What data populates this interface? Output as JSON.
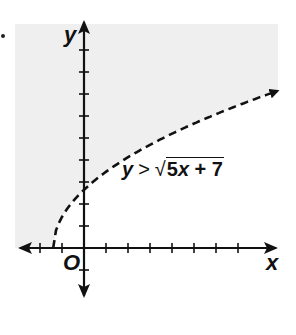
{
  "figure": {
    "axis_labels": {
      "x": "x",
      "y": "y",
      "origin": "O"
    },
    "inequality": {
      "lhs": "y",
      "operator": ">",
      "radical": "√",
      "radicand_coeff": "5",
      "radicand_var": "x",
      "radicand_rest": " + 7"
    },
    "boundary_style": "dashed",
    "shaded_region": "above curve",
    "colors": {
      "shade": "#efefef",
      "axis": "#111111",
      "curve": "#111111"
    }
  },
  "chart_data": {
    "type": "line",
    "title": "",
    "equation": "y > sqrt(5x + 7)",
    "boundary": "y = sqrt(5x + 7)",
    "boundary_line": "dashed",
    "shading": "region above the curve (y > sqrt(5x+7))",
    "xlabel": "x",
    "ylabel": "y",
    "origin_label": "O",
    "xlim": [
      -3,
      9
    ],
    "ylim": [
      -1,
      9
    ],
    "tick_spacing": 1,
    "grid": false,
    "x": [
      -1.4,
      -1,
      0,
      1,
      2,
      3,
      4,
      5,
      6,
      7,
      8,
      8.8
    ],
    "y": [
      0,
      1.41,
      2.65,
      3.46,
      4.12,
      4.69,
      5.2,
      5.66,
      6.08,
      6.48,
      6.86,
      7.14
    ]
  }
}
